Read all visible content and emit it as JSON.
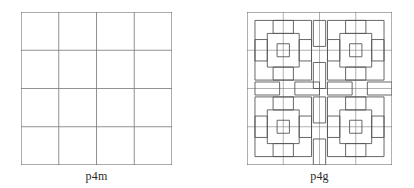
{
  "figures": [
    {
      "id": "p4m",
      "label": "p4m",
      "kind": "plain-grid",
      "x": 21,
      "y": 12,
      "width": 151,
      "height": 153,
      "grid_divisions": 4,
      "line_color": "#7d7d7d",
      "border_color": "#6e6e6e",
      "fill_color": "#ffffff",
      "line_width": 1
    },
    {
      "id": "p4g",
      "label": "p4g",
      "kind": "pinwheel-tiling",
      "x": 247,
      "y": 12,
      "width": 145,
      "height": 153,
      "grid_divisions": 4,
      "motif": "swastika-pinwheel",
      "motif_blocks": 2,
      "line_color": "#7d7d7d",
      "border_color": "#6e6e6e",
      "motif_color": "#555555",
      "fill_color": "#ffffff",
      "line_width": 1
    }
  ],
  "page": {
    "background": "#ffffff",
    "width": 414,
    "height": 188
  }
}
